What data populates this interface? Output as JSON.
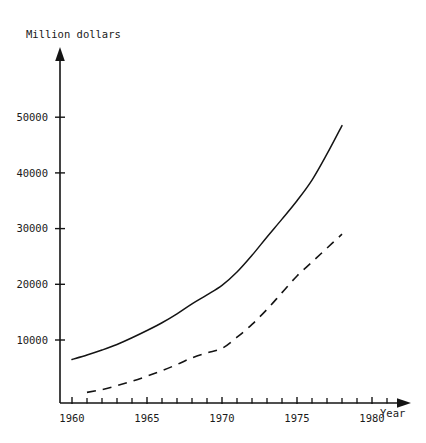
{
  "chart_data": {
    "type": "line",
    "title": "",
    "ylabel": "Million dollars",
    "xlabel": "Year",
    "grid": false,
    "legend": "none",
    "xlim": [
      1959.2,
      1981.8
    ],
    "ylim": [
      0,
      57000
    ],
    "x_ticks_major": [
      1960,
      1965,
      1970,
      1975,
      1980
    ],
    "x_tick_labels": [
      "1960",
      "1965",
      "1970",
      "1975",
      "1980"
    ],
    "x_ticks_all": [
      1960,
      1961,
      1962,
      1963,
      1964,
      1965,
      1966,
      1967,
      1968,
      1969,
      1970,
      1971,
      1972,
      1973,
      1974,
      1975,
      1976,
      1977,
      1978,
      1979,
      1980,
      1981
    ],
    "y_ticks": [
      10000,
      20000,
      30000,
      40000,
      50000
    ],
    "y_tick_labels": [
      "10000",
      "20000",
      "30000",
      "40000",
      "50000"
    ],
    "series": [
      {
        "name": "solid-curve",
        "style": "solid",
        "x": [
          1960,
          1961,
          1962,
          1963,
          1964,
          1965,
          1966,
          1967,
          1968,
          1969,
          1970,
          1971,
          1972,
          1973,
          1974,
          1975,
          1976,
          1977,
          1978
        ],
        "values": [
          6500,
          7300,
          8200,
          9200,
          10400,
          11700,
          13100,
          14700,
          16500,
          18100,
          19800,
          22200,
          25200,
          28500,
          31700,
          35000,
          38700,
          43400,
          48500
        ]
      },
      {
        "name": "dashed-curve",
        "style": "dashed",
        "x": [
          1961,
          1962,
          1963,
          1964,
          1965,
          1966,
          1967,
          1968,
          1969,
          1970,
          1971,
          1972,
          1973,
          1974,
          1975,
          1976,
          1977,
          1978
        ],
        "values": [
          600,
          1100,
          1800,
          2600,
          3500,
          4500,
          5600,
          6800,
          7700,
          8500,
          10500,
          12800,
          15500,
          18500,
          21500,
          24000,
          26500,
          29000
        ]
      }
    ]
  },
  "axis_labels": {
    "y_title": "Million dollars",
    "x_title": "Year"
  },
  "colors": {
    "ink": "#141414",
    "background": "#ffffff"
  }
}
